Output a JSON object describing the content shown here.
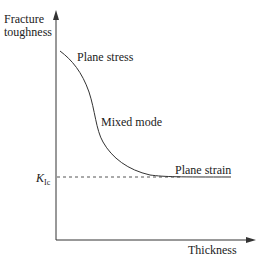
{
  "diagram": {
    "y_axis_label_line1": "Fracture",
    "y_axis_label_line2": "toughness",
    "x_axis_label": "Thickness",
    "kic_label_main": "K",
    "kic_label_sub": "Ic",
    "regions": {
      "plane_stress": "Plane stress",
      "mixed_mode": "Mixed mode",
      "plane_strain": "Plane strain"
    },
    "colors": {
      "line": "#333333",
      "dashed": "#555555"
    }
  }
}
